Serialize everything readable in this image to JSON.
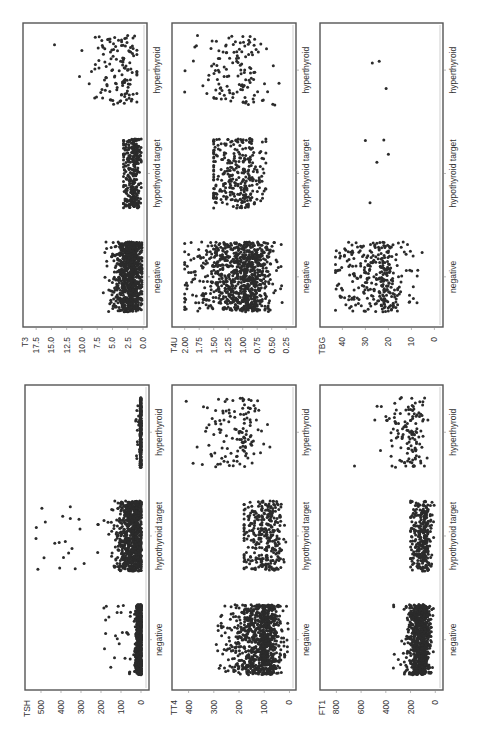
{
  "figure": {
    "orientation": "rotated 90 degrees counter-clockwise",
    "categories": [
      "negative",
      "hypothyroid target",
      "hyperthyroid"
    ],
    "dot_color": "#2b2b2b",
    "frame_color": "#555555"
  },
  "chart_data": [
    {
      "type": "scatter",
      "title": "T3",
      "ylabel": "T3",
      "categories": [
        "negative",
        "hypothyroid target",
        "hyperthyroid"
      ],
      "ylim": [
        0,
        19
      ],
      "yticks": [
        0.0,
        2.5,
        5.0,
        7.5,
        10.0,
        12.5,
        15.0,
        17.5
      ],
      "ytick_labels": [
        "0.0",
        "2.5",
        "5.0",
        "7.5",
        "10.0",
        "12.5",
        "15.0",
        "17.5"
      ],
      "series": [
        {
          "name": "negative",
          "center": 1.9,
          "spread": 1.4,
          "outlier_range": [
            0.2,
            6.5
          ],
          "density": "high"
        },
        {
          "name": "hypothyroid target",
          "center": 1.6,
          "spread": 1.0,
          "outlier_range": [
            0.3,
            3.2
          ],
          "density": "medium"
        },
        {
          "name": "hyperthyroid",
          "center": 3.5,
          "spread": 2.2,
          "outlier_range": [
            1.0,
            10.5
          ],
          "extreme_points": [
            14.5,
            10.0
          ],
          "density": "low"
        }
      ],
      "grid": false,
      "legend": "none"
    },
    {
      "type": "scatter",
      "title": "T4U",
      "ylabel": "T4U",
      "categories": [
        "negative",
        "hypothyroid target",
        "hyperthyroid"
      ],
      "ylim": [
        0.15,
        2.15
      ],
      "yticks": [
        0.25,
        0.5,
        0.75,
        1.0,
        1.25,
        1.5,
        1.75,
        2.0
      ],
      "ytick_labels": [
        "0.25",
        "0.50",
        "0.75",
        "1.00",
        "1.25",
        "1.50",
        "1.75",
        "2.00"
      ],
      "series": [
        {
          "name": "negative",
          "center": 1.0,
          "spread": 0.4,
          "outlier_range": [
            0.3,
            2.0
          ],
          "density": "high"
        },
        {
          "name": "hypothyroid target",
          "center": 1.05,
          "spread": 0.35,
          "outlier_range": [
            0.6,
            1.5
          ],
          "density": "medium"
        },
        {
          "name": "hyperthyroid",
          "center": 1.1,
          "spread": 0.4,
          "outlier_range": [
            0.3,
            2.0
          ],
          "density": "low"
        }
      ],
      "grid": false,
      "legend": "none"
    },
    {
      "type": "scatter",
      "title": "TBG",
      "ylabel": "TBG",
      "categories": [
        "negative",
        "hypothyroid target",
        "hyperthyroid"
      ],
      "ylim": [
        -2,
        48
      ],
      "yticks": [
        0,
        10,
        20,
        30,
        40
      ],
      "ytick_labels": [
        "0",
        "10",
        "20",
        "30",
        "40"
      ],
      "series": [
        {
          "name": "negative",
          "center": 24,
          "spread": 10,
          "outlier_range": [
            2,
            43
          ],
          "density": "medium"
        },
        {
          "name": "hypothyroid target",
          "points": [
            28,
            25,
            22,
            20,
            30
          ]
        },
        {
          "name": "hyperthyroid",
          "points": [
            27,
            24,
            21
          ]
        }
      ],
      "grid": false,
      "legend": "none"
    },
    {
      "type": "scatter",
      "title": "TSH",
      "ylabel": "TSH",
      "categories": [
        "negative",
        "hypothyroid target",
        "hyperthyroid"
      ],
      "ylim": [
        -20,
        560
      ],
      "yticks": [
        0,
        100,
        200,
        300,
        400,
        500
      ],
      "ytick_labels": [
        "0",
        "100",
        "200",
        "300",
        "400",
        "500"
      ],
      "series": [
        {
          "name": "negative",
          "center": 5,
          "spread": 10,
          "outlier_range": [
            0,
            190
          ],
          "density": "high"
        },
        {
          "name": "hypothyroid target",
          "center": 35,
          "spread": 40,
          "outlier_range": [
            0,
            530
          ],
          "density": "high"
        },
        {
          "name": "hyperthyroid",
          "center": 1,
          "spread": 2,
          "outlier_range": [
            0,
            30
          ],
          "density": "medium"
        }
      ],
      "grid": false,
      "legend": "none"
    },
    {
      "type": "scatter",
      "title": "TT4",
      "ylabel": "TT4",
      "categories": [
        "negative",
        "hypothyroid target",
        "hyperthyroid"
      ],
      "ylim": [
        -10,
        450
      ],
      "yticks": [
        0,
        100,
        200,
        300,
        400
      ],
      "ytick_labels": [
        "0",
        "100",
        "200",
        "300",
        "400"
      ],
      "series": [
        {
          "name": "negative",
          "center": 110,
          "spread": 60,
          "outlier_range": [
            5,
            290
          ],
          "density": "high"
        },
        {
          "name": "hypothyroid target",
          "center": 95,
          "spread": 55,
          "outlier_range": [
            10,
            180
          ],
          "density": "medium"
        },
        {
          "name": "hyperthyroid",
          "center": 200,
          "spread": 80,
          "outlier_range": [
            60,
            430
          ],
          "density": "low"
        }
      ],
      "grid": false,
      "legend": "none"
    },
    {
      "type": "scatter",
      "title": "FTI",
      "ylabel": "FT1",
      "categories": [
        "negative",
        "hypothyroid target",
        "hyperthyroid"
      ],
      "ylim": [
        -30,
        900
      ],
      "yticks": [
        0,
        200,
        400,
        600,
        800
      ],
      "ytick_labels": [
        "0",
        "200",
        "400",
        "600",
        "800"
      ],
      "series": [
        {
          "name": "negative",
          "center": 110,
          "spread": 50,
          "outlier_range": [
            10,
            340
          ],
          "density": "high"
        },
        {
          "name": "hypothyroid target",
          "center": 100,
          "spread": 50,
          "outlier_range": [
            10,
            200
          ],
          "density": "medium"
        },
        {
          "name": "hyperthyroid",
          "center": 200,
          "spread": 90,
          "outlier_range": [
            60,
            860
          ],
          "density": "low"
        }
      ],
      "grid": false,
      "legend": "none"
    }
  ],
  "panels": [
    {
      "var": "T3",
      "label": "T3",
      "x0": 23,
      "x1": 147,
      "y0": 23,
      "y1": 327
    },
    {
      "var": "T4U",
      "label": "T4U",
      "x0": 172,
      "x1": 296,
      "y0": 23,
      "y1": 327
    },
    {
      "var": "TBG",
      "label": "TBG",
      "x0": 320,
      "x1": 443,
      "y0": 23,
      "y1": 327
    },
    {
      "var": "TSH",
      "label": "TSH",
      "x0": 25,
      "x1": 149,
      "y0": 385,
      "y1": 690
    },
    {
      "var": "TT4",
      "label": "TT4",
      "x0": 172,
      "x1": 296,
      "y0": 385,
      "y1": 690
    },
    {
      "var": "FTI",
      "label": "FT1",
      "x0": 320,
      "x1": 443,
      "y0": 385,
      "y1": 690
    }
  ]
}
